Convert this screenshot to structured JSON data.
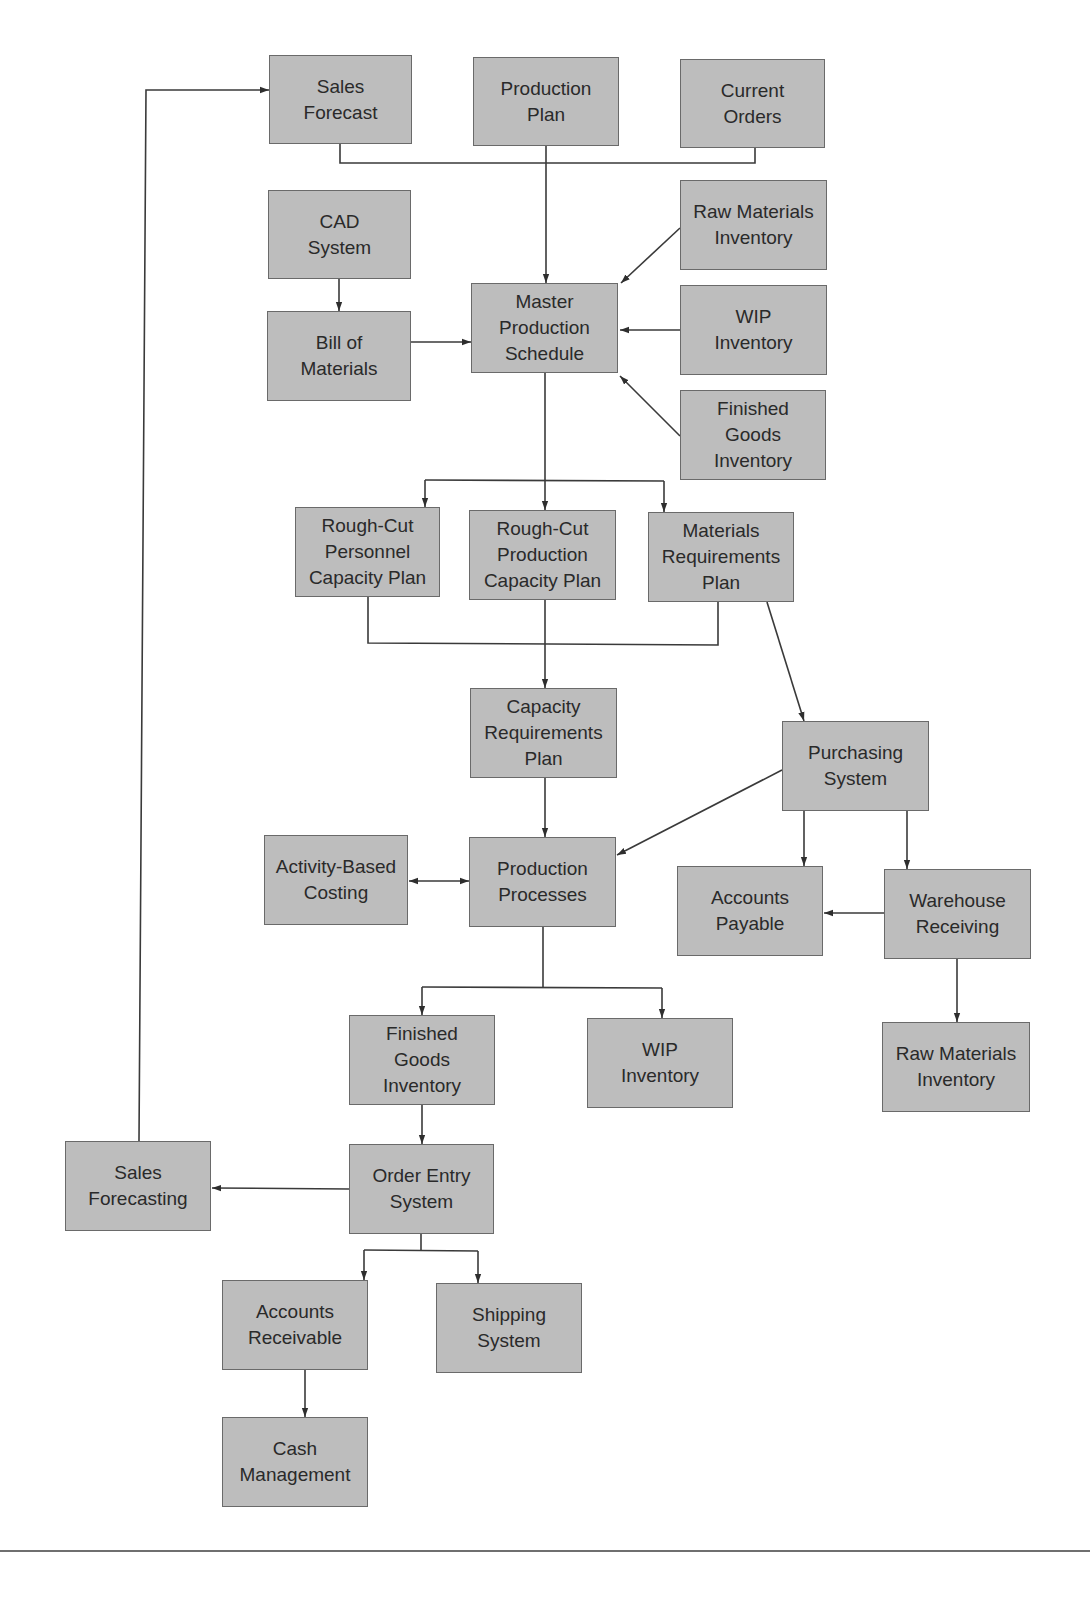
{
  "diagram": {
    "type": "flowchart",
    "colors": {
      "box_fill": "#bdbdbd",
      "box_border": "#6a6a6a",
      "text": "#2a2a2a",
      "line": "#3a3a3a",
      "rule": "#6f6f6f"
    },
    "nodes": [
      {
        "id": "sales_forecast",
        "lines": [
          "Sales",
          "Forecast"
        ],
        "x": 269,
        "y": 55,
        "w": 143,
        "h": 89
      },
      {
        "id": "production_plan",
        "lines": [
          "Production",
          "Plan"
        ],
        "x": 473,
        "y": 57,
        "w": 146,
        "h": 89
      },
      {
        "id": "current_orders",
        "lines": [
          "Current",
          "Orders"
        ],
        "x": 680,
        "y": 59,
        "w": 145,
        "h": 89
      },
      {
        "id": "cad_system",
        "lines": [
          "CAD",
          "System"
        ],
        "x": 268,
        "y": 190,
        "w": 143,
        "h": 89
      },
      {
        "id": "raw_materials_inventory_top",
        "lines": [
          "Raw Materials",
          "Inventory"
        ],
        "x": 680,
        "y": 180,
        "w": 147,
        "h": 90
      },
      {
        "id": "bill_of_materials",
        "lines": [
          "Bill of",
          "Materials"
        ],
        "x": 267,
        "y": 311,
        "w": 144,
        "h": 90
      },
      {
        "id": "master_production_schedule",
        "lines": [
          "Master",
          "Production",
          "Schedule"
        ],
        "x": 471,
        "y": 283,
        "w": 147,
        "h": 90
      },
      {
        "id": "wip_inventory_top",
        "lines": [
          "WIP",
          "Inventory"
        ],
        "x": 680,
        "y": 285,
        "w": 147,
        "h": 90
      },
      {
        "id": "finished_goods_inventory_top",
        "lines": [
          "Finished",
          "Goods",
          "Inventory"
        ],
        "x": 680,
        "y": 390,
        "w": 146,
        "h": 90
      },
      {
        "id": "rough_cut_personnel",
        "lines": [
          "Rough-Cut",
          "Personnel",
          "Capacity Plan"
        ],
        "x": 295,
        "y": 507,
        "w": 145,
        "h": 90
      },
      {
        "id": "rough_cut_production",
        "lines": [
          "Rough-Cut",
          "Production",
          "Capacity Plan"
        ],
        "x": 469,
        "y": 510,
        "w": 147,
        "h": 90
      },
      {
        "id": "materials_requirements_plan",
        "lines": [
          "Materials",
          "Requirements",
          "Plan"
        ],
        "x": 648,
        "y": 512,
        "w": 146,
        "h": 90
      },
      {
        "id": "capacity_requirements_plan",
        "lines": [
          "Capacity",
          "Requirements",
          "Plan"
        ],
        "x": 470,
        "y": 688,
        "w": 147,
        "h": 90
      },
      {
        "id": "purchasing_system",
        "lines": [
          "Purchasing",
          "System"
        ],
        "x": 782,
        "y": 721,
        "w": 147,
        "h": 90
      },
      {
        "id": "activity_based_costing",
        "lines": [
          "Activity-Based",
          "Costing"
        ],
        "x": 264,
        "y": 835,
        "w": 144,
        "h": 90
      },
      {
        "id": "production_processes",
        "lines": [
          "Production",
          "Processes"
        ],
        "x": 469,
        "y": 837,
        "w": 147,
        "h": 90
      },
      {
        "id": "accounts_payable",
        "lines": [
          "Accounts",
          "Payable"
        ],
        "x": 677,
        "y": 866,
        "w": 146,
        "h": 90
      },
      {
        "id": "warehouse_receiving",
        "lines": [
          "Warehouse",
          "Receiving"
        ],
        "x": 884,
        "y": 869,
        "w": 147,
        "h": 90
      },
      {
        "id": "finished_goods_inventory_bottom",
        "lines": [
          "Finished",
          "Goods",
          "Inventory"
        ],
        "x": 349,
        "y": 1015,
        "w": 146,
        "h": 90
      },
      {
        "id": "wip_inventory_bottom",
        "lines": [
          "WIP",
          "Inventory"
        ],
        "x": 587,
        "y": 1018,
        "w": 146,
        "h": 90
      },
      {
        "id": "raw_materials_inventory_bottom",
        "lines": [
          "Raw Materials",
          "Inventory"
        ],
        "x": 882,
        "y": 1022,
        "w": 148,
        "h": 90
      },
      {
        "id": "sales_forecasting",
        "lines": [
          "Sales",
          "Forecasting"
        ],
        "x": 65,
        "y": 1141,
        "w": 146,
        "h": 90
      },
      {
        "id": "order_entry_system",
        "lines": [
          "Order Entry",
          "System"
        ],
        "x": 349,
        "y": 1144,
        "w": 145,
        "h": 90
      },
      {
        "id": "accounts_receivable",
        "lines": [
          "Accounts",
          "Receivable"
        ],
        "x": 222,
        "y": 1280,
        "w": 146,
        "h": 90
      },
      {
        "id": "shipping_system",
        "lines": [
          "Shipping",
          "System"
        ],
        "x": 436,
        "y": 1283,
        "w": 146,
        "h": 90
      },
      {
        "id": "cash_management",
        "lines": [
          "Cash",
          "Management"
        ],
        "x": 222,
        "y": 1417,
        "w": 146,
        "h": 90
      }
    ],
    "edges": [
      {
        "from": "sales_forecast",
        "to": "master_production_schedule",
        "label": ""
      },
      {
        "from": "production_plan",
        "to": "master_production_schedule",
        "label": ""
      },
      {
        "from": "current_orders",
        "to": "master_production_schedule",
        "label": ""
      },
      {
        "from": "cad_system",
        "to": "bill_of_materials",
        "label": ""
      },
      {
        "from": "bill_of_materials",
        "to": "master_production_schedule",
        "label": ""
      },
      {
        "from": "raw_materials_inventory_top",
        "to": "master_production_schedule",
        "label": ""
      },
      {
        "from": "wip_inventory_top",
        "to": "master_production_schedule",
        "label": ""
      },
      {
        "from": "finished_goods_inventory_top",
        "to": "master_production_schedule",
        "label": ""
      },
      {
        "from": "master_production_schedule",
        "to": "rough_cut_personnel",
        "label": ""
      },
      {
        "from": "master_production_schedule",
        "to": "rough_cut_production",
        "label": ""
      },
      {
        "from": "master_production_schedule",
        "to": "materials_requirements_plan",
        "label": ""
      },
      {
        "from": "rough_cut_personnel",
        "to": "capacity_requirements_plan",
        "label": ""
      },
      {
        "from": "rough_cut_production",
        "to": "capacity_requirements_plan",
        "label": ""
      },
      {
        "from": "materials_requirements_plan",
        "to": "capacity_requirements_plan",
        "label": ""
      },
      {
        "from": "materials_requirements_plan",
        "to": "purchasing_system",
        "label": ""
      },
      {
        "from": "capacity_requirements_plan",
        "to": "production_processes",
        "label": ""
      },
      {
        "from": "purchasing_system",
        "to": "production_processes",
        "label": ""
      },
      {
        "from": "purchasing_system",
        "to": "accounts_payable",
        "label": ""
      },
      {
        "from": "purchasing_system",
        "to": "warehouse_receiving",
        "label": ""
      },
      {
        "from": "warehouse_receiving",
        "to": "accounts_payable",
        "label": ""
      },
      {
        "from": "warehouse_receiving",
        "to": "raw_materials_inventory_bottom",
        "label": ""
      },
      {
        "from": "activity_based_costing",
        "to": "production_processes",
        "label": "",
        "bidirectional": true
      },
      {
        "from": "production_processes",
        "to": "finished_goods_inventory_bottom",
        "label": ""
      },
      {
        "from": "production_processes",
        "to": "wip_inventory_bottom",
        "label": ""
      },
      {
        "from": "finished_goods_inventory_bottom",
        "to": "order_entry_system",
        "label": ""
      },
      {
        "from": "order_entry_system",
        "to": "sales_forecasting",
        "label": ""
      },
      {
        "from": "order_entry_system",
        "to": "accounts_receivable",
        "label": ""
      },
      {
        "from": "order_entry_system",
        "to": "shipping_system",
        "label": ""
      },
      {
        "from": "accounts_receivable",
        "to": "cash_management",
        "label": ""
      },
      {
        "from": "sales_forecasting",
        "to": "sales_forecast",
        "label": ""
      }
    ]
  }
}
